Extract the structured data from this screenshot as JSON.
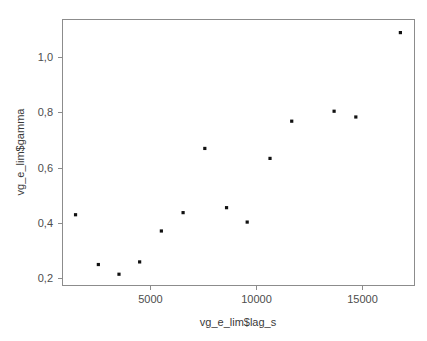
{
  "chart_data": {
    "type": "scatter",
    "title": "",
    "xlabel": "vg_e_lim$lag_s",
    "ylabel": "vg_e_lim$gamma",
    "xlim": [
      1000,
      17200
    ],
    "ylim": [
      0.155,
      1.17
    ],
    "xticks": [
      5000,
      10000,
      15000
    ],
    "xtick_labels": [
      "5000",
      "10000",
      "15000"
    ],
    "yticks": [
      0.2,
      0.4,
      0.6,
      0.8,
      1.0
    ],
    "ytick_labels": [
      "0,2",
      "0,4",
      "0,6",
      "0,8",
      "1,0"
    ],
    "grid": false,
    "legend": false,
    "marker": "filled-square",
    "marker_color": "#111111",
    "points": [
      {
        "x": 1600,
        "y": 0.425
      },
      {
        "x": 2650,
        "y": 0.235
      },
      {
        "x": 3600,
        "y": 0.198
      },
      {
        "x": 4550,
        "y": 0.245
      },
      {
        "x": 5550,
        "y": 0.363
      },
      {
        "x": 6550,
        "y": 0.433
      },
      {
        "x": 7550,
        "y": 0.678
      },
      {
        "x": 8550,
        "y": 0.452
      },
      {
        "x": 9500,
        "y": 0.397
      },
      {
        "x": 10550,
        "y": 0.64
      },
      {
        "x": 11550,
        "y": 0.782
      },
      {
        "x": 13500,
        "y": 0.82
      },
      {
        "x": 14500,
        "y": 0.798
      },
      {
        "x": 16550,
        "y": 1.12
      }
    ]
  },
  "axes": {
    "x_axis_label": "vg_e_lim$lag_s",
    "y_axis_label": "vg_e_lim$gamma",
    "x_tick_1": "5000",
    "x_tick_2": "10000",
    "x_tick_3": "15000",
    "y_tick_1": "0,2",
    "y_tick_2": "0,4",
    "y_tick_3": "0,6",
    "y_tick_4": "0,8",
    "y_tick_5": "1,0"
  },
  "colors": {
    "point": "#111111",
    "frame": "#8c8c8c",
    "text": "#4d4d4d",
    "background": "#ffffff"
  }
}
